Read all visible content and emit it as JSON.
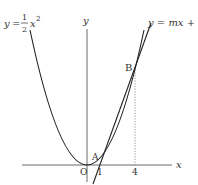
{
  "diagram": {
    "curve_label": {
      "lhs": "y",
      "eq": "=",
      "num": "1",
      "den": "2",
      "var": "x",
      "exp": "2"
    },
    "line_label": "y = mx + n",
    "axis_x_label": "x",
    "axis_y_label": "y",
    "origin_label": "O",
    "point_a_label": "A",
    "point_b_label": "B",
    "tick_1_label": "1",
    "tick_4_label": "4",
    "colors": {
      "stroke": "#222222",
      "dotted": "#777777",
      "text": "#333333"
    }
  }
}
